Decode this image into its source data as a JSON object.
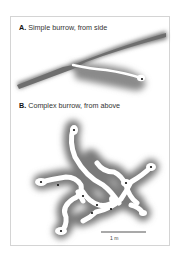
{
  "figure": {
    "panel_a": {
      "letter": "A.",
      "title": "Simple burrow, from side"
    },
    "panel_b": {
      "letter": "B.",
      "title": "Complex burrow, from above"
    },
    "scale_bar": {
      "label": "1 m"
    },
    "colors": {
      "soil": "#7a7a7a",
      "burrow": "#ffffff",
      "chamber_dot": "#111111",
      "border": "#d4d4d4"
    }
  }
}
